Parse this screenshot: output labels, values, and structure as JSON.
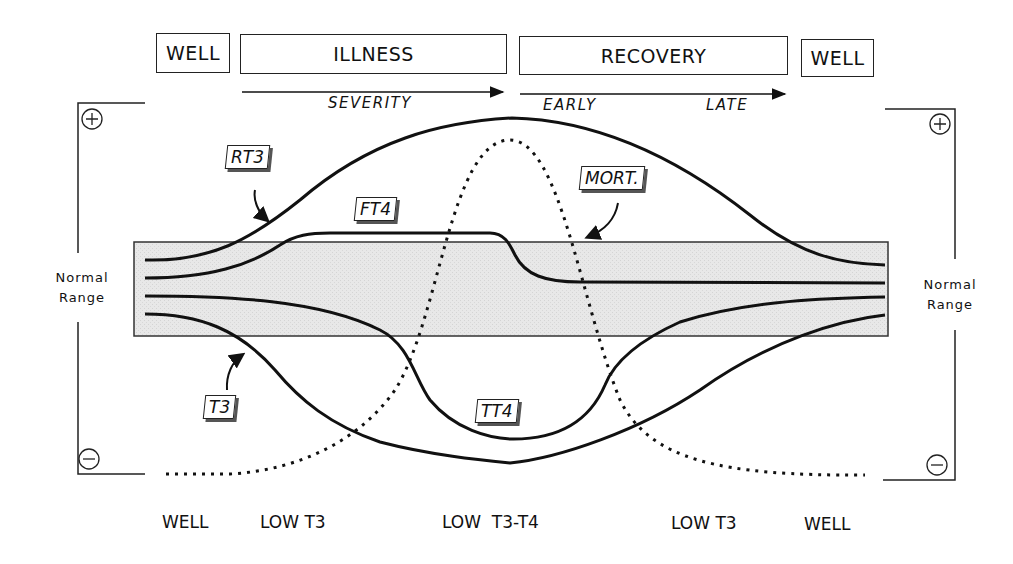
{
  "phases": {
    "well_left": "WELL",
    "illness": "ILLNESS",
    "recovery": "RECOVERY",
    "well_right": "WELL"
  },
  "arrows": {
    "severity": "SEVERITY",
    "early": "EARLY",
    "late": "LATE"
  },
  "axis": {
    "plus_symbol": "+",
    "minus_symbol": "−",
    "normal_range_line1": "Normal",
    "normal_range_line2": "Range"
  },
  "curve_labels": {
    "rt3": "RT3",
    "ft4": "FT4",
    "mort": "MORT.",
    "t3": "T3",
    "tt4": "TT4"
  },
  "bottom_stages": [
    "WELL",
    "LOW T3",
    "LOW  T3-T4",
    "LOW T3",
    "WELL"
  ],
  "colors": {
    "line": "#111111",
    "normal_band": "#e6e6e6",
    "band_border": "#333333"
  }
}
